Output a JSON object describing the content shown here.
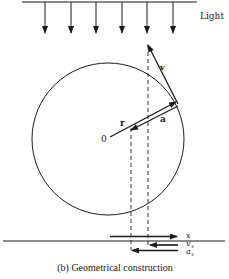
{
  "figure": {
    "caption": "(b) Geometrical construction",
    "light_label": "Light",
    "labels": {
      "origin": "0",
      "radius": "r",
      "acceleration": "a",
      "velocity": "v",
      "x": "x",
      "v_x_base": "v",
      "v_x_sub": "x",
      "a_x_base": "a",
      "a_x_sub": "x"
    },
    "colors": {
      "stroke": "#1a1a1a",
      "background": "#ffffff"
    }
  }
}
